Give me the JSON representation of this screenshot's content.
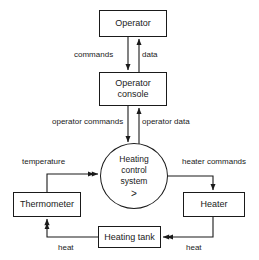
{
  "diagram": {
    "type": "data-flow-diagram",
    "background_color": "#ffffff",
    "stroke_color": "#1a1a1a",
    "nodes": {
      "operator": {
        "label": "Operator",
        "shape": "rectangle"
      },
      "operator_console": {
        "line1": "Operator",
        "line2": "console",
        "shape": "rectangle"
      },
      "heating_control_system": {
        "line1": "Heating",
        "line2": "control",
        "line3": "system",
        "marker": ">",
        "shape": "circle"
      },
      "thermometer": {
        "label": "Thermometer",
        "shape": "rectangle"
      },
      "heater": {
        "label": "Heater",
        "shape": "rectangle"
      },
      "heating_tank": {
        "label": "Heating tank",
        "shape": "rectangle"
      }
    },
    "edges": {
      "commands": "commands",
      "data": "data",
      "operator_commands": "operator commands",
      "operator_data": "operator data",
      "temperature": "temperature",
      "heater_commands": "heater commands",
      "heat_left": "heat",
      "heat_right": "heat"
    }
  }
}
